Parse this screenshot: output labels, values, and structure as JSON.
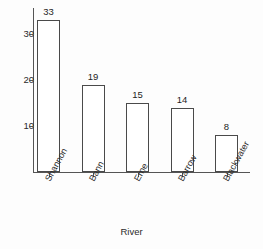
{
  "chart_data": {
    "type": "bar",
    "title": "",
    "subtitle": "",
    "xlabel": "River",
    "ylabel": "",
    "categories": [
      "Shannon",
      "Bann",
      "Erne",
      "Barrow",
      "Blackwater"
    ],
    "values": [
      33,
      19,
      15,
      14,
      8
    ],
    "value_labels": [
      "33",
      "19",
      "15",
      "14",
      "8"
    ],
    "y_ticks": [
      10,
      20,
      30
    ],
    "y_tick_labels": [
      "10",
      "20",
      "30"
    ],
    "ylim": [
      0,
      36
    ],
    "grid": false,
    "legend": null,
    "legend_position": "none",
    "bar_fill_color": "#ffffff",
    "bar_edge_color": "#4a4a4a",
    "axis_color": "#555555",
    "text_color": "#2b2b2b",
    "background_color": "#fdfdfd",
    "x_tick_label_rotation": "-61"
  }
}
